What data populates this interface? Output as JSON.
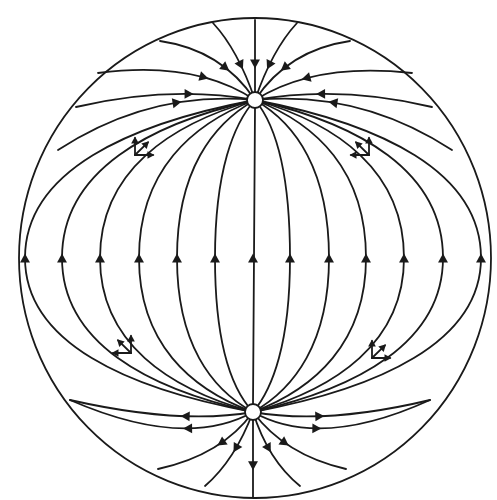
{
  "diagram": {
    "type": "phase-portrait",
    "colors": {
      "line": "#1a1a1a",
      "background": "#ffffff",
      "node_fill": "#ffffff"
    },
    "boundary": {
      "shape": "ellipse",
      "cx": 255,
      "cy": 258,
      "rx": 236,
      "ry": 240
    },
    "nodes": [
      {
        "id": "top-node",
        "cx": 255,
        "cy": 100,
        "r": 8,
        "role": "sink"
      },
      {
        "id": "bottom-node",
        "cx": 253,
        "cy": 412,
        "r": 8,
        "role": "source"
      }
    ],
    "meridian_x_at_equator": [
      25,
      62,
      100,
      139,
      177,
      215,
      253,
      290,
      329,
      366,
      404,
      443,
      481
    ],
    "equator_y": 258,
    "arrow_direction_at_equator": "up",
    "vector_glyphs": [
      {
        "x": 135,
        "y": 155,
        "quadrant": "upper-left",
        "vectors": [
          "up",
          "right",
          "tangent-up-right"
        ]
      },
      {
        "x": 369,
        "y": 155,
        "quadrant": "upper-right",
        "vectors": [
          "up",
          "left",
          "tangent-up-left"
        ]
      },
      {
        "x": 131,
        "y": 353,
        "quadrant": "lower-left",
        "vectors": [
          "up",
          "left",
          "tangent-up-left"
        ]
      },
      {
        "x": 372,
        "y": 358,
        "quadrant": "lower-right",
        "vectors": [
          "up",
          "right",
          "tangent-up-right"
        ]
      }
    ]
  }
}
